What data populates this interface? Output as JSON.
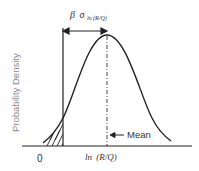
{
  "diagram": {
    "type": "lognormal probability density illustration",
    "y_axis_label": "Probability Density",
    "x_origin_label": "0",
    "x_mean_label": {
      "func": "ln",
      "arg": "(R/Q)"
    },
    "mean_annotation": "Mean",
    "distance_label": {
      "beta": "β",
      "sigma": "σ",
      "subscript": "ln (R/Q)"
    },
    "shaded_region": "failure probability tail (hatched)",
    "colors": {
      "line": "#222222",
      "axis_label": "#8a8a8a",
      "background": "#ffffff"
    }
  }
}
